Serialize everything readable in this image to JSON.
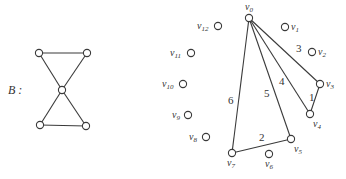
{
  "graph_b": {
    "label": "B :",
    "nodes": [
      {
        "id": "tl",
        "x": 39,
        "y": 53
      },
      {
        "id": "tr",
        "x": 87,
        "y": 53
      },
      {
        "id": "c",
        "x": 62,
        "y": 90
      },
      {
        "id": "bl",
        "x": 40,
        "y": 125
      },
      {
        "id": "br",
        "x": 86,
        "y": 126
      }
    ],
    "edges": [
      [
        "tl",
        "tr"
      ],
      [
        "tl",
        "c"
      ],
      [
        "tr",
        "c"
      ],
      [
        "c",
        "bl"
      ],
      [
        "c",
        "br"
      ],
      [
        "bl",
        "br"
      ]
    ]
  },
  "graph_cycle": {
    "nodes": [
      {
        "id": "v0",
        "base": "v",
        "sub": "0",
        "x": 249,
        "y": 18,
        "lx": 245,
        "ly": 10
      },
      {
        "id": "v1",
        "base": "v",
        "sub": "1",
        "x": 285,
        "y": 27,
        "lx": 291,
        "ly": 30
      },
      {
        "id": "v2",
        "base": "v",
        "sub": "2",
        "x": 312,
        "y": 52,
        "lx": 318,
        "ly": 55
      },
      {
        "id": "v3",
        "base": "v",
        "sub": "3",
        "x": 320,
        "y": 84,
        "lx": 326,
        "ly": 87
      },
      {
        "id": "v4",
        "base": "v",
        "sub": "4",
        "x": 310,
        "y": 114,
        "lx": 313,
        "ly": 127
      },
      {
        "id": "v5",
        "base": "v",
        "sub": "5",
        "x": 291,
        "y": 139,
        "lx": 294,
        "ly": 152
      },
      {
        "id": "v6",
        "base": "v",
        "sub": "6",
        "x": 269,
        "y": 154,
        "lx": 265,
        "ly": 167
      },
      {
        "id": "v7",
        "base": "v",
        "sub": "7",
        "x": 232,
        "y": 153,
        "lx": 227,
        "ly": 166
      },
      {
        "id": "v8",
        "base": "v",
        "sub": "8",
        "x": 206,
        "y": 137,
        "lx": 189,
        "ly": 140
      },
      {
        "id": "v9",
        "base": "v",
        "sub": "9",
        "x": 188,
        "y": 115,
        "lx": 172,
        "ly": 118
      },
      {
        "id": "v10",
        "base": "v",
        "sub": "10",
        "x": 183,
        "y": 84,
        "lx": 162,
        "ly": 87
      },
      {
        "id": "v11",
        "base": "v",
        "sub": "11",
        "x": 191,
        "y": 53,
        "lx": 170,
        "ly": 56
      },
      {
        "id": "v12",
        "base": "v",
        "sub": "12",
        "x": 218,
        "y": 26,
        "lx": 197,
        "ly": 29
      }
    ],
    "edges": [
      {
        "from": "v0",
        "to": "v3",
        "weight": "3",
        "wx": 296,
        "wy": 52
      },
      {
        "from": "v0",
        "to": "v4",
        "weight": "4",
        "wx": 279,
        "wy": 85
      },
      {
        "from": "v0",
        "to": "v5",
        "weight": "5",
        "wx": 264,
        "wy": 97
      },
      {
        "from": "v0",
        "to": "v7",
        "weight": "6",
        "wx": 228,
        "wy": 104
      },
      {
        "from": "v3",
        "to": "v4",
        "weight": "1",
        "wx": 309,
        "wy": 101
      },
      {
        "from": "v5",
        "to": "v7",
        "weight": "2",
        "wx": 259,
        "wy": 141
      }
    ]
  }
}
